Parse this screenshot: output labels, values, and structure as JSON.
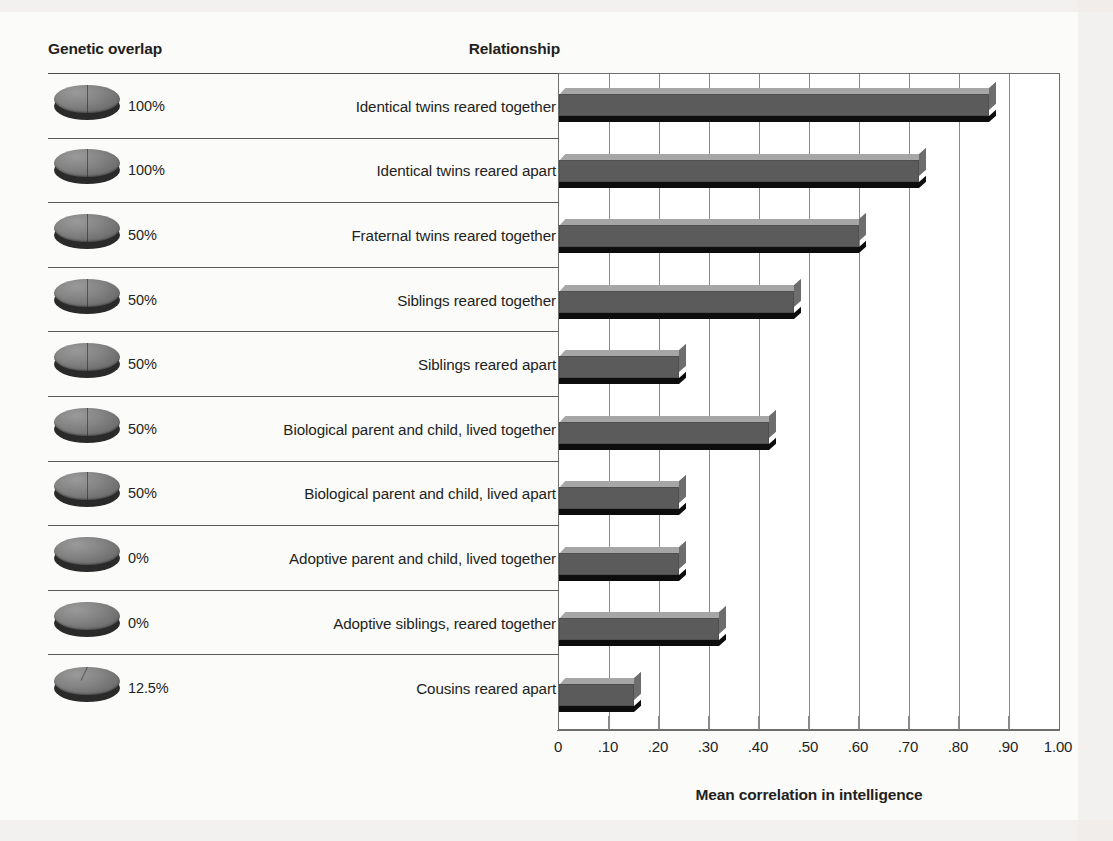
{
  "headers": {
    "genetic_overlap": "Genetic overlap",
    "relationship": "Relationship"
  },
  "axis": {
    "title": "Mean correlation in intelligence",
    "ticks": [
      "0",
      ".10",
      ".20",
      ".30",
      ".40",
      ".50",
      ".60",
      ".70",
      ".80",
      ".90",
      "1.00"
    ]
  },
  "colors": {
    "bar_front": "#5b5b5b",
    "bar_top": "#a6a6a6",
    "bar_under": "#0d0d0d",
    "gridline": "#8a8a8a",
    "text": "#231f20",
    "page": "#fbfbfa"
  },
  "rows": [
    {
      "overlap": "100%",
      "overlap_fraction": 1.0,
      "relationship": "Identical twins reared together",
      "correlation": 0.86,
      "icon": "genetic-disc-icon"
    },
    {
      "overlap": "100%",
      "overlap_fraction": 1.0,
      "relationship": "Identical twins reared apart",
      "correlation": 0.72,
      "icon": "genetic-disc-icon"
    },
    {
      "overlap": "50%",
      "overlap_fraction": 0.5,
      "relationship": "Fraternal twins reared together",
      "correlation": 0.6,
      "icon": "genetic-disc-icon"
    },
    {
      "overlap": "50%",
      "overlap_fraction": 0.5,
      "relationship": "Siblings reared together",
      "correlation": 0.47,
      "icon": "genetic-disc-icon"
    },
    {
      "overlap": "50%",
      "overlap_fraction": 0.5,
      "relationship": "Siblings reared apart",
      "correlation": 0.24,
      "icon": "genetic-disc-icon"
    },
    {
      "overlap": "50%",
      "overlap_fraction": 0.5,
      "relationship": "Biological parent and child, lived together",
      "correlation": 0.42,
      "icon": "genetic-disc-icon"
    },
    {
      "overlap": "50%",
      "overlap_fraction": 0.5,
      "relationship": "Biological parent and child, lived apart",
      "correlation": 0.24,
      "icon": "genetic-disc-icon"
    },
    {
      "overlap": "0%",
      "overlap_fraction": 0.0,
      "relationship": "Adoptive parent and child, lived together",
      "correlation": 0.24,
      "icon": "genetic-disc-icon"
    },
    {
      "overlap": "0%",
      "overlap_fraction": 0.0,
      "relationship": "Adoptive siblings, reared together",
      "correlation": 0.32,
      "icon": "genetic-disc-icon"
    },
    {
      "overlap": "12.5%",
      "overlap_fraction": 0.125,
      "relationship": "Cousins reared apart",
      "correlation": 0.15,
      "icon": "genetic-disc-icon"
    }
  ],
  "chart_data": {
    "type": "bar",
    "orientation": "horizontal",
    "title": "",
    "xlabel": "Mean correlation in intelligence",
    "ylabel": "Relationship",
    "xlim": [
      0,
      1.0
    ],
    "xticks": [
      0,
      0.1,
      0.2,
      0.3,
      0.4,
      0.5,
      0.6,
      0.7,
      0.8,
      0.9,
      1.0
    ],
    "xticklabels": [
      "0",
      ".10",
      ".20",
      ".30",
      ".40",
      ".50",
      ".60",
      ".70",
      ".80",
      ".90",
      "1.00"
    ],
    "grid": "vertical",
    "legend": "none",
    "categories": [
      "Identical twins reared together",
      "Identical twins reared apart",
      "Fraternal twins reared together",
      "Siblings reared together",
      "Siblings reared apart",
      "Biological parent and child, lived together",
      "Biological parent and child, lived apart",
      "Adoptive parent and child, lived together",
      "Adoptive siblings, reared together",
      "Cousins reared apart"
    ],
    "values": [
      0.86,
      0.72,
      0.6,
      0.47,
      0.24,
      0.42,
      0.24,
      0.24,
      0.32,
      0.15
    ],
    "annotations": {
      "genetic_overlap": [
        "100%",
        "100%",
        "50%",
        "50%",
        "50%",
        "50%",
        "50%",
        "0%",
        "0%",
        "12.5%"
      ]
    }
  }
}
